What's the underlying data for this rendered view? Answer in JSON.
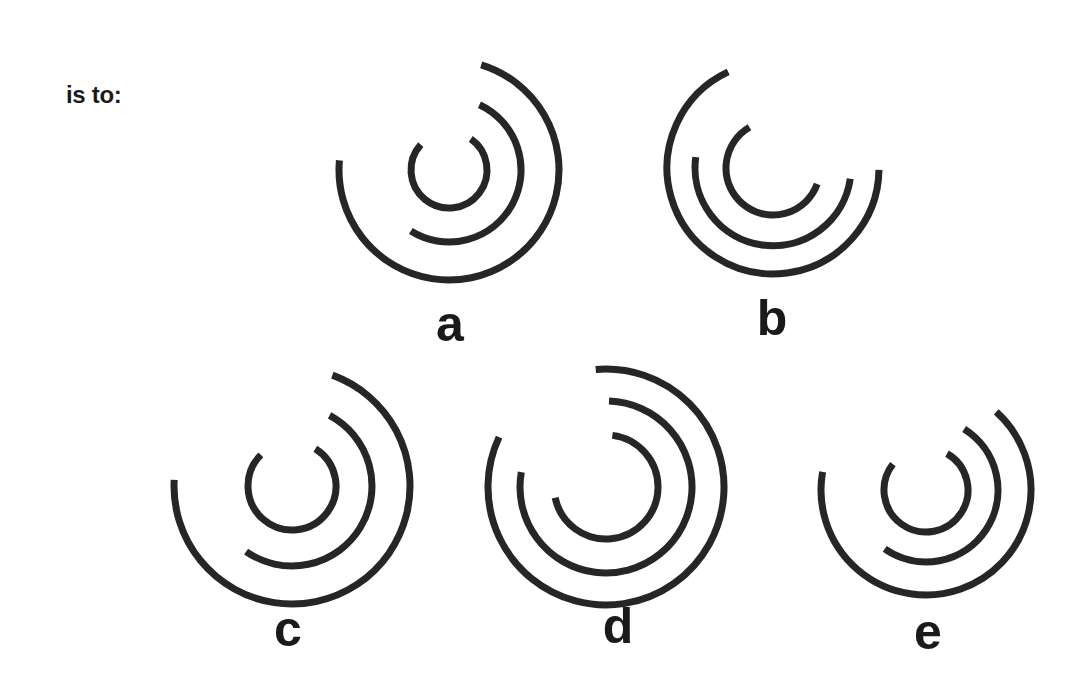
{
  "page": {
    "background_color": "#ffffff",
    "stroke_color": "#262626",
    "text_color": "#1a1a1a",
    "width": 1083,
    "height": 692
  },
  "prompt": {
    "text": "is to:"
  },
  "options": [
    {
      "id": "a",
      "label": "a",
      "label_x": 450,
      "label_y": 299
    },
    {
      "id": "b",
      "label": "b",
      "label_x": 772,
      "label_y": 293
    },
    {
      "id": "c",
      "label": "c",
      "label_x": 288,
      "label_y": 604
    },
    {
      "id": "d",
      "label": "d",
      "label_x": 618,
      "label_y": 601
    },
    {
      "id": "e",
      "label": "e",
      "label_x": 928,
      "label_y": 607
    }
  ],
  "chart_data": {
    "type": "diagram",
    "title": "",
    "stroke_width": 7,
    "figures": [
      {
        "id": "a",
        "cx": 449,
        "cy": 170,
        "arcs": [
          {
            "ring": "inner",
            "radius": 38,
            "start_deg": -55,
            "end_deg": 222
          },
          {
            "ring": "middle",
            "radius": 72,
            "start_deg": -65,
            "end_deg": 122
          },
          {
            "ring": "outer",
            "radius": 110,
            "start_deg": -73,
            "end_deg": 185
          }
        ]
      },
      {
        "id": "b",
        "cx": 773,
        "cy": 168,
        "arcs": [
          {
            "ring": "inner",
            "radius": 47,
            "start_deg": 20,
            "end_deg": 240
          },
          {
            "ring": "middle",
            "radius": 78,
            "start_deg": 8,
            "end_deg": 188
          },
          {
            "ring": "outer",
            "radius": 106,
            "start_deg": 1,
            "end_deg": 245
          }
        ]
      },
      {
        "id": "c",
        "cx": 292,
        "cy": 486,
        "arcs": [
          {
            "ring": "inner",
            "radius": 44,
            "start_deg": -58,
            "end_deg": 225
          },
          {
            "ring": "middle",
            "radius": 80,
            "start_deg": -62,
            "end_deg": 125
          },
          {
            "ring": "outer",
            "radius": 118,
            "start_deg": -70,
            "end_deg": 183
          }
        ]
      },
      {
        "id": "d",
        "cx": 606,
        "cy": 487,
        "arcs": [
          {
            "ring": "inner",
            "radius": 52,
            "start_deg": -83,
            "end_deg": 168
          },
          {
            "ring": "middle",
            "radius": 86,
            "start_deg": -88,
            "end_deg": 190
          },
          {
            "ring": "outer",
            "radius": 118,
            "start_deg": -95,
            "end_deg": 205
          }
        ]
      },
      {
        "id": "e",
        "cx": 926,
        "cy": 490,
        "arcs": [
          {
            "ring": "inner",
            "radius": 42,
            "start_deg": -60,
            "end_deg": 218
          },
          {
            "ring": "middle",
            "radius": 72,
            "start_deg": -58,
            "end_deg": 125
          },
          {
            "ring": "outer",
            "radius": 105,
            "start_deg": -48,
            "end_deg": 190
          }
        ]
      }
    ]
  }
}
